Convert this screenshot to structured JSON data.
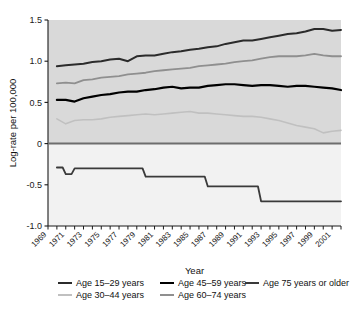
{
  "figure": {
    "title": "",
    "background_color": "#ffffff",
    "plot_background_upper": "#d9d9d9",
    "plot_background_lower": "#f2f2f2"
  },
  "axes": {
    "ylabel": "Log-rate per 100,000",
    "xlabel": "Year",
    "yticks": [
      "1.5",
      "1.0",
      "0.5",
      "0",
      "-0.5",
      "-1.0"
    ],
    "xticks": [
      "1969",
      "1971",
      "1973",
      "1975",
      "1977",
      "1979",
      "1981",
      "1983",
      "1985",
      "1987",
      "1989",
      "1991",
      "1993",
      "1995",
      "1997",
      "1999",
      "2001"
    ]
  },
  "legend": {
    "entries": [
      {
        "label": "Age 15–29 years",
        "color": "#2b2b2b"
      },
      {
        "label": "Age 45–59 years",
        "color": "#000000"
      },
      {
        "label": "Age 75 years or older",
        "color": "#3a3a3a"
      },
      {
        "label": "Age 30–44 years",
        "color": "#c0c0c0"
      },
      {
        "label": "Age 60–74 years",
        "color": "#8f8f8f"
      }
    ]
  },
  "chart_data": {
    "type": "line",
    "title": "",
    "xlabel": "Year",
    "ylabel": "Log-rate per 100,000",
    "xlim": [
      1969,
      2002
    ],
    "ylim": [
      -1.0,
      1.5
    ],
    "grid": false,
    "legend_position": "bottom",
    "zero_reference_line": 0,
    "x": [
      1970,
      1971,
      1972,
      1973,
      1974,
      1975,
      1976,
      1977,
      1978,
      1979,
      1980,
      1981,
      1982,
      1983,
      1984,
      1985,
      1986,
      1987,
      1988,
      1989,
      1990,
      1991,
      1992,
      1993,
      1994,
      1995,
      1996,
      1997,
      1998,
      1999,
      2000,
      2001,
      2002
    ],
    "series": [
      {
        "name": "Age 15–29 years",
        "color": "#2b2b2b",
        "width": 2.0,
        "values": [
          0.94,
          0.95,
          0.96,
          0.97,
          0.99,
          1.0,
          1.02,
          1.03,
          1.0,
          1.06,
          1.07,
          1.07,
          1.09,
          1.11,
          1.12,
          1.14,
          1.15,
          1.17,
          1.18,
          1.21,
          1.23,
          1.25,
          1.25,
          1.27,
          1.29,
          1.31,
          1.33,
          1.34,
          1.36,
          1.39,
          1.39,
          1.37,
          1.38
        ]
      },
      {
        "name": "Age 30–44 years",
        "color": "#c0c0c0",
        "width": 1.6,
        "values": [
          0.3,
          0.24,
          0.28,
          0.29,
          0.29,
          0.3,
          0.32,
          0.33,
          0.34,
          0.35,
          0.36,
          0.35,
          0.36,
          0.37,
          0.38,
          0.39,
          0.37,
          0.37,
          0.36,
          0.35,
          0.34,
          0.33,
          0.33,
          0.32,
          0.3,
          0.28,
          0.25,
          0.22,
          0.2,
          0.18,
          0.13,
          0.15,
          0.16
        ]
      },
      {
        "name": "Age 45–59 years",
        "color": "#000000",
        "width": 2.2,
        "values": [
          0.53,
          0.53,
          0.51,
          0.55,
          0.57,
          0.59,
          0.6,
          0.62,
          0.63,
          0.63,
          0.65,
          0.66,
          0.68,
          0.69,
          0.67,
          0.68,
          0.68,
          0.7,
          0.71,
          0.72,
          0.72,
          0.71,
          0.7,
          0.71,
          0.71,
          0.7,
          0.69,
          0.7,
          0.7,
          0.69,
          0.68,
          0.67,
          0.65
        ]
      },
      {
        "name": "Age 60–74 years",
        "color": "#8f8f8f",
        "width": 1.8,
        "values": [
          0.73,
          0.74,
          0.73,
          0.77,
          0.78,
          0.8,
          0.81,
          0.82,
          0.84,
          0.85,
          0.86,
          0.88,
          0.89,
          0.9,
          0.91,
          0.92,
          0.94,
          0.95,
          0.96,
          0.97,
          0.99,
          1.0,
          1.01,
          1.03,
          1.05,
          1.06,
          1.06,
          1.06,
          1.07,
          1.09,
          1.07,
          1.06,
          1.06
        ]
      },
      {
        "name": "Age 75 years or older",
        "color": "#3a3a3a",
        "width": 1.8,
        "step": true,
        "values": [
          -0.29,
          -0.37,
          -0.3,
          -0.3,
          -0.3,
          -0.3,
          -0.3,
          -0.3,
          -0.3,
          -0.3,
          -0.4,
          -0.4,
          -0.4,
          -0.4,
          -0.4,
          -0.4,
          -0.4,
          -0.52,
          -0.52,
          -0.52,
          -0.52,
          -0.52,
          -0.52,
          -0.7,
          -0.7,
          -0.7,
          -0.7,
          -0.7,
          -0.7,
          -0.7,
          -0.7,
          -0.7,
          -0.7
        ]
      }
    ]
  }
}
